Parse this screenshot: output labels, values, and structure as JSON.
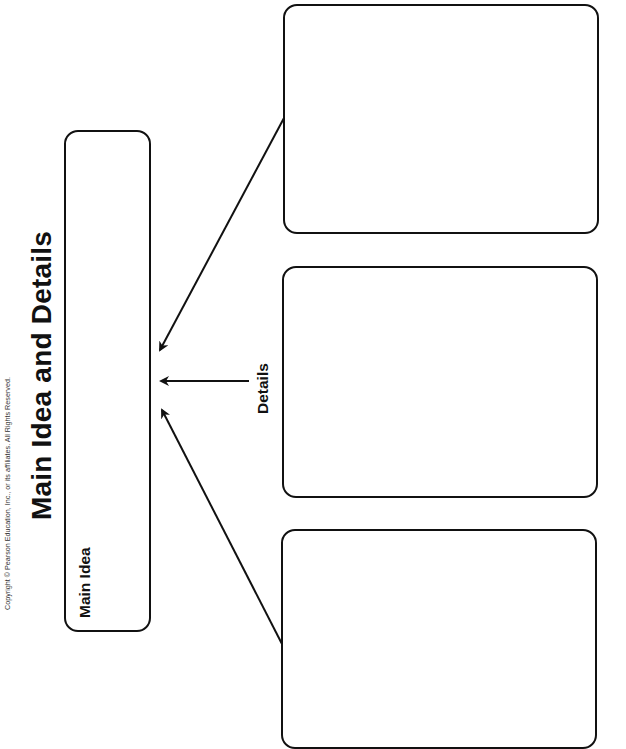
{
  "page": {
    "title": "Main Idea and Details",
    "copyright": "Copyright © Pearson Education, Inc., or its affiliates. All Rights Reserved.",
    "main_idea": {
      "label": "Main Idea",
      "content": ""
    },
    "details": {
      "label": "Details",
      "boxes": [
        {
          "content": ""
        },
        {
          "content": ""
        },
        {
          "content": ""
        }
      ]
    },
    "colors": {
      "ink": "#111111",
      "background": "#ffffff"
    }
  }
}
